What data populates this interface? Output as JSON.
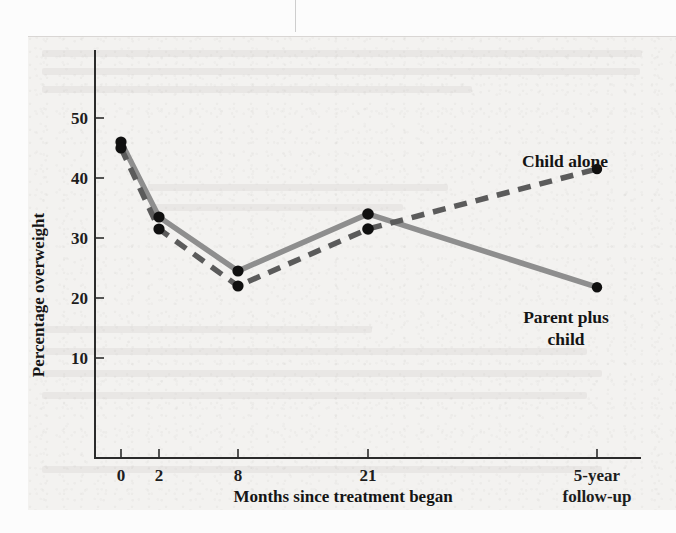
{
  "figure": {
    "background_color": "#f3f2f0",
    "series_colors": {
      "parent_plus_child": "#8e8e8e",
      "child_alone": "#5b5b5b",
      "marker": "#101010",
      "axis": "#2b2b2b"
    }
  },
  "chart_data": {
    "type": "line",
    "title": "",
    "xlabel": "Months since treatment began",
    "ylabel": "Percentage overweight",
    "categories": [
      "0",
      "2",
      "8",
      "21",
      "5-year\nfollow-up"
    ],
    "x_tick_labels": [
      "0",
      "2",
      "8",
      "21",
      "5-year",
      "follow-up"
    ],
    "x_positions": [
      0,
      2,
      8,
      21,
      60
    ],
    "y_tick_labels": [
      "10",
      "20",
      "30",
      "40",
      "50"
    ],
    "y_ticks": [
      10,
      20,
      30,
      40,
      50
    ],
    "ylim": [
      0,
      56
    ],
    "grid": false,
    "legend_position": "inline-annotations",
    "series": [
      {
        "name": "Parent plus child",
        "style": "solid",
        "color": "#8e8e8e",
        "values": [
          46,
          33.5,
          24.5,
          34,
          21.8
        ]
      },
      {
        "name": "Child alone",
        "style": "dashed",
        "color": "#5b5b5b",
        "values": [
          45,
          31.5,
          22,
          31.5,
          41.5
        ]
      }
    ],
    "annotations": [
      {
        "text": "Child alone",
        "for_series": "Child alone"
      },
      {
        "text": "Parent plus",
        "for_series": "Parent plus child"
      },
      {
        "text": "child",
        "for_series": "Parent plus child"
      }
    ]
  },
  "labels": {
    "y_axis_title": "Percentage overweight",
    "x_axis_title": "Months since treatment began",
    "x_tick_0": "0",
    "x_tick_1": "2",
    "x_tick_2": "8",
    "x_tick_3": "21",
    "x_tick_4_line1": "5-year",
    "x_tick_4_line2": "follow-up",
    "y_tick_10": "10",
    "y_tick_20": "20",
    "y_tick_30": "30",
    "y_tick_40": "40",
    "y_tick_50": "50",
    "series_label_child_alone": "Child alone",
    "series_label_parent_line1": "Parent plus",
    "series_label_parent_line2": "child"
  }
}
